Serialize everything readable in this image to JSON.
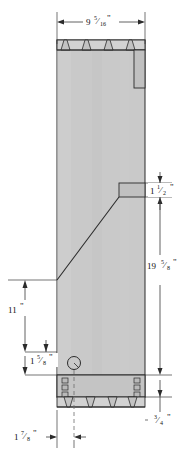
{
  "drawing": {
    "title": "Cabinet Side Panel Elevation",
    "type": "woodworking-technical-drawing",
    "units": "inches",
    "background_color": "#ffffff",
    "panel_fill": "#c9c9c9",
    "panel_fill_dark": "#bdbdbd",
    "joint_fill": "#d2d2d2",
    "line_color": "#2b2b2b",
    "dim_line_color": "#3a3a3a",
    "hidden_line_color": "#6d6d6d"
  },
  "dimensions": {
    "width_top": {
      "whole": "9",
      "num": "5",
      "den": "16",
      "mark": "\"",
      "full": "9 5/16\"",
      "position": "top",
      "orientation": "horizontal"
    },
    "notch_height": {
      "whole": "1",
      "num": "1",
      "den": "2",
      "mark": "\"",
      "full": "1 1/2\"",
      "position": "right-upper",
      "orientation": "vertical"
    },
    "overall_height": {
      "whole": "19",
      "num": "5",
      "den": "8",
      "mark": "\"",
      "full": "19 5/8\"",
      "position": "right",
      "orientation": "vertical"
    },
    "left_height": {
      "whole": "11",
      "num": "",
      "den": "",
      "mark": "\"",
      "full": "11\"",
      "position": "left",
      "orientation": "vertical"
    },
    "knob_offset": {
      "whole": "1",
      "num": "5",
      "den": "8",
      "mark": "\"",
      "full": "1 5/8\"",
      "position": "left-lower",
      "orientation": "vertical"
    },
    "bottom_thickness": {
      "whole": "",
      "num": "3",
      "den": "4",
      "mark": "\"",
      "full": "3/4\"",
      "position": "right-bottom",
      "orientation": "vertical"
    },
    "bottom_offset": {
      "whole": "1",
      "num": "7",
      "den": "8",
      "mark": "\"",
      "full": "1 7/8\"",
      "position": "bottom-left",
      "orientation": "horizontal"
    }
  },
  "features": {
    "top_dovetails": {
      "name": "top-dovetail-pins",
      "count": 4
    },
    "bottom_dovetails": {
      "name": "bottom-dovetail-pins",
      "count": 4
    },
    "right_dado": {
      "name": "right-side-dado-groove"
    },
    "right_notch": {
      "name": "right-side-notch"
    },
    "diagonal_cut": {
      "name": "diagonal-profile-cut"
    },
    "knob_hole": {
      "name": "knob-hole-circle"
    },
    "bottom_box": {
      "name": "bottom-rail-assembly"
    },
    "finger_joints": {
      "name": "bottom-box-finger-joints",
      "count": 6
    },
    "center_line": {
      "name": "vertical-center-line"
    }
  }
}
